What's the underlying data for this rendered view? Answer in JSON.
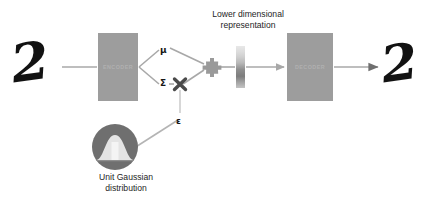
{
  "diagram": {
    "background_color": "#ffffff",
    "box_color": "#9d9d9d",
    "line_color": "#a8a8a8",
    "digit_color": "#121212"
  },
  "input": {
    "name": "input-handwritten-digit",
    "glyph": "2"
  },
  "output": {
    "name": "output-handwritten-digit",
    "glyph": "2"
  },
  "encoder": {
    "label": "ENCODER"
  },
  "decoder": {
    "label": "DECODER"
  },
  "latent": {
    "caption_line_1": "Lower dimensional",
    "caption_line_2": "representation",
    "caption": "Lower dimensional representation"
  },
  "parameters": {
    "mu": "μ",
    "sigma": "Σ",
    "epsilon": "ε"
  },
  "operators": {
    "multiply": "multiply-node",
    "sum": "sum-node"
  },
  "gaussian": {
    "caption_line_1": "Unit Gaussian",
    "caption_line_2": "distribution",
    "caption": "Unit Gaussian distribution",
    "icon": "gaussian-bell-curve-icon"
  }
}
